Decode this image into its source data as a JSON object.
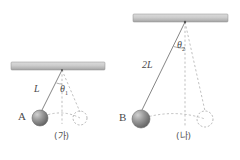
{
  "figure": {
    "background_color": "#ffffff",
    "ink_color": "#4a4a4a",
    "dash_color": "#9a9a9a",
    "bar_fill_top": "#d8d8d8",
    "bar_fill_bottom": "#a8a8a8",
    "ball_fill_light": "#c9c9c9",
    "ball_fill_dark": "#6f6f6f"
  },
  "panels": [
    {
      "id": "panel-a",
      "caption": "(가)",
      "caption_x": 56,
      "caption_y": 136,
      "ceiling": {
        "x": 11,
        "y": 62,
        "width": 94,
        "height": 8
      },
      "pivot": {
        "x": 62,
        "y": 70
      },
      "string": {
        "length_label": "L",
        "label_x": 38,
        "label_y": 90
      },
      "angle": {
        "symbol": "θ",
        "subscript": "1",
        "label_x": 62,
        "label_y": 90,
        "degrees": 24
      },
      "ball": {
        "label": "A",
        "label_x": 20,
        "label_y": 113,
        "cx": 40,
        "cy": 118,
        "r": 8
      },
      "rest_circle": {
        "cx": 80,
        "cy": 118,
        "r": 7
      },
      "equilibrium_line": {
        "x": 62,
        "y1": 70,
        "y2": 122
      }
    },
    {
      "id": "panel-b",
      "caption": "(나)",
      "caption_x": 178,
      "caption_y": 136,
      "ceiling": {
        "x": 133,
        "y": 14,
        "width": 95,
        "height": 8
      },
      "pivot": {
        "x": 185,
        "y": 22
      },
      "string": {
        "length_label": "2L",
        "label_x": 146,
        "label_y": 66
      },
      "angle": {
        "symbol": "θ",
        "subscript": "2",
        "label_x": 185,
        "label_y": 47,
        "degrees": 24
      },
      "ball": {
        "label": "B",
        "label_x": 122,
        "label_y": 114,
        "cx": 141,
        "cy": 119,
        "r": 9
      },
      "rest_circle": {
        "cx": 205,
        "cy": 119,
        "r": 8
      },
      "equilibrium_line": {
        "x": 185,
        "y1": 22,
        "y2": 124
      }
    }
  ]
}
